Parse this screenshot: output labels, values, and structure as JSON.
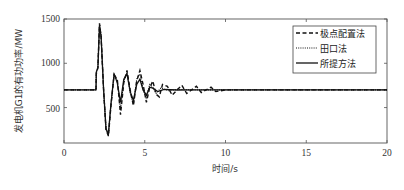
{
  "chart_data": {
    "type": "line",
    "title": "",
    "xlabel": "时间/s",
    "ylabel": "发电机G1的有功功率/MW",
    "xlim": [
      0,
      20
    ],
    "ylim": [
      100,
      1500
    ],
    "xticks": [
      0,
      5,
      10,
      15,
      20
    ],
    "yticks": [
      500,
      1000,
      1500
    ],
    "xtick_labels": [
      "0",
      "5",
      "10",
      "15",
      "20"
    ],
    "ytick_labels": [
      "500",
      "1000",
      "1500"
    ],
    "grid": false,
    "legend_position": "upper right",
    "series": [
      {
        "name": "极点配置法",
        "style": "dashed",
        "x": [
          0,
          1.98,
          2.0,
          2.1,
          2.2,
          2.3,
          2.45,
          2.6,
          2.75,
          2.9,
          3.1,
          3.3,
          3.5,
          3.7,
          3.9,
          4.1,
          4.3,
          4.5,
          4.7,
          4.9,
          5.1,
          5.3,
          5.5,
          5.7,
          5.9,
          6.1,
          6.4,
          6.7,
          7.0,
          7.3,
          7.6,
          7.9,
          8.2,
          8.5,
          8.8,
          9.1,
          9.4,
          10,
          12,
          14,
          16,
          18,
          20
        ],
        "y": [
          700,
          700,
          880,
          950,
          1450,
          1300,
          700,
          250,
          180,
          500,
          870,
          820,
          420,
          780,
          920,
          700,
          520,
          800,
          920,
          760,
          560,
          720,
          800,
          650,
          620,
          760,
          740,
          640,
          700,
          750,
          660,
          700,
          740,
          670,
          700,
          730,
          680,
          700,
          700,
          700,
          700,
          700,
          700
        ]
      },
      {
        "name": "田口法",
        "style": "dotted",
        "x": [
          0,
          1.98,
          2.0,
          2.1,
          2.2,
          2.3,
          2.45,
          2.6,
          2.75,
          2.9,
          3.1,
          3.3,
          3.5,
          3.7,
          3.9,
          4.1,
          4.3,
          4.5,
          4.7,
          4.9,
          5.1,
          5.3,
          5.5,
          5.7,
          6.0,
          6.5,
          7.0,
          8,
          10,
          12,
          14,
          16,
          18,
          20
        ],
        "y": [
          700,
          700,
          900,
          950,
          1440,
          1320,
          700,
          260,
          190,
          520,
          880,
          800,
          480,
          800,
          900,
          660,
          540,
          820,
          880,
          700,
          600,
          760,
          730,
          660,
          720,
          690,
          705,
          700,
          700,
          700,
          700,
          700,
          700,
          700
        ]
      },
      {
        "name": "所提方法",
        "style": "solid",
        "x": [
          0,
          1.98,
          2.0,
          2.1,
          2.2,
          2.3,
          2.45,
          2.6,
          2.75,
          2.9,
          3.1,
          3.3,
          3.5,
          3.7,
          3.9,
          4.1,
          4.3,
          4.5,
          4.7,
          4.9,
          5.1,
          5.3,
          5.5,
          5.8,
          6.2,
          7.0,
          8,
          10,
          12,
          14,
          16,
          18,
          20
        ],
        "y": [
          700,
          700,
          900,
          950,
          1430,
          1300,
          700,
          260,
          200,
          520,
          880,
          780,
          560,
          820,
          880,
          680,
          580,
          760,
          820,
          700,
          640,
          730,
          720,
          680,
          705,
          698,
          700,
          700,
          700,
          700,
          700,
          700,
          700
        ]
      }
    ]
  },
  "axes": {
    "xlabel": "时间/s",
    "ylabel": "发电机G1的有功功率/MW",
    "xtick_labels": [
      "0",
      "5",
      "10",
      "15",
      "20"
    ],
    "ytick_labels": [
      "500",
      "1000",
      "1500"
    ]
  },
  "legend": {
    "items": [
      {
        "label": "极点配置法",
        "style": "dashed"
      },
      {
        "label": "田口法",
        "style": "dotted"
      },
      {
        "label": "所提方法",
        "style": "solid"
      }
    ]
  },
  "colors": {
    "line": "#111111",
    "axis": "#444444"
  }
}
